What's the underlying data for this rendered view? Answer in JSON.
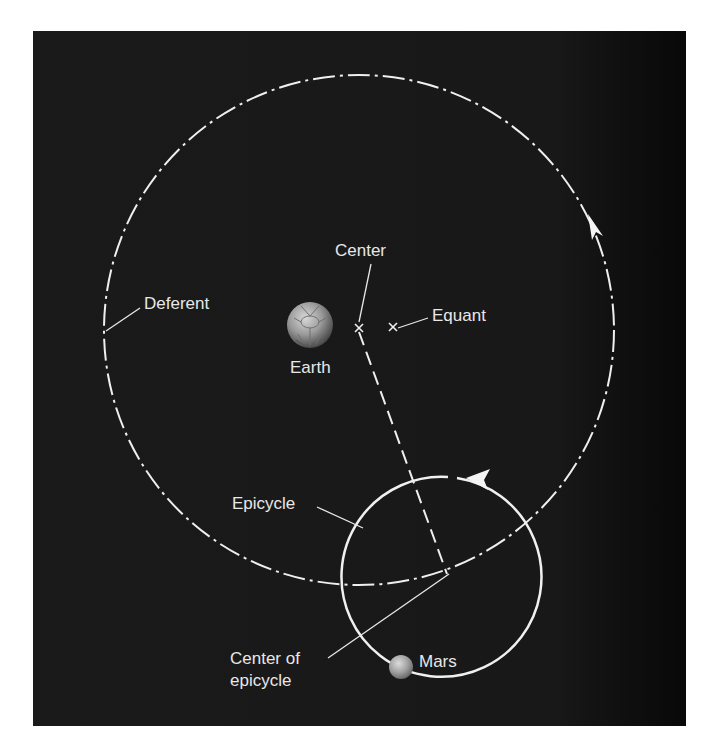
{
  "diagram": {
    "background_color": "#1a1a1a",
    "line_color": "#f0f0f0",
    "labels": {
      "deferent": "Deferent",
      "center": "Center",
      "equant": "Equant",
      "earth": "Earth",
      "epicycle": "Epicycle",
      "center_of_epicycle_line1": "Center of",
      "center_of_epicycle_line2": "epicycle",
      "mars": "Mars"
    },
    "elements": {
      "deferent_circle": {
        "cx": 359,
        "cy": 330,
        "r": 255,
        "style": "dash-dot"
      },
      "epicycle_circle": {
        "cx": 448,
        "cy": 577,
        "r": 100,
        "style": "solid"
      },
      "earth": {
        "cx": 310,
        "cy": 325,
        "r": 23
      },
      "center_mark": {
        "x": 359,
        "y": 328
      },
      "equant_mark": {
        "x": 393,
        "y": 327
      },
      "mars": {
        "cx": 400,
        "cy": 664,
        "r": 12
      }
    }
  }
}
